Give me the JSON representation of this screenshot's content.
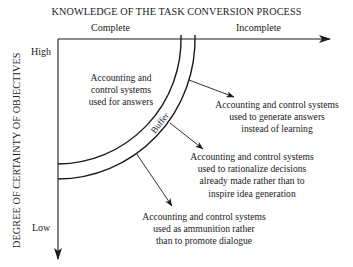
{
  "diagram": {
    "title": "KNOWLEDGE OF THE TASK CONVERSION PROCESS",
    "x_axis": {
      "labels": [
        "Complete",
        "Incomplete"
      ]
    },
    "y_axis": {
      "title": "DEGREE OF CERTAINTY OF OBJECTIVES",
      "labels": [
        "High",
        "Low"
      ]
    },
    "buffer_label": "Buffer",
    "inner_region": {
      "lines": [
        "Accounting and",
        "control systems",
        "used for answers"
      ]
    },
    "outcomes": [
      {
        "lines": [
          "Accounting and control systems",
          "used to generate answers",
          "instead of learning"
        ]
      },
      {
        "lines": [
          "Accounting and control systems",
          "used to rationalize decisions",
          "already made rather than to",
          "inspire idea generation"
        ]
      },
      {
        "lines": [
          "Accounting and control systems",
          "used as ammunition rather",
          "than to promote dialogue"
        ]
      }
    ],
    "colors": {
      "ink": "#1a1a1a",
      "background": "#ffffff"
    }
  }
}
